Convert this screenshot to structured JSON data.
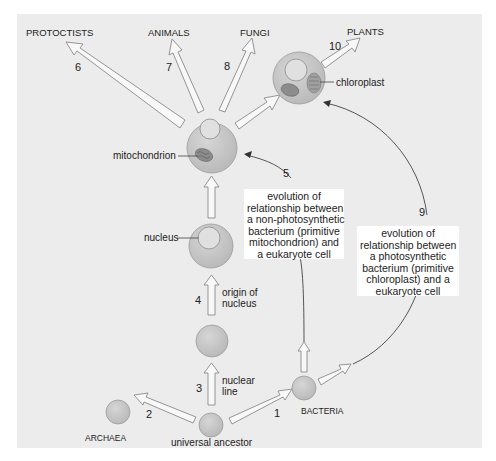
{
  "diagram": {
    "type": "evolutionary-tree",
    "colors": {
      "panel": "#ececec",
      "cell_fill": "#c8c8c8",
      "cell_stroke": "#9a9a9a",
      "nucleus_fill": "#e4e4e4",
      "arrow_fill": "#f8f8f8",
      "arrow_stroke": "#8a8a8a",
      "organelle_fill": "#8c8c8c",
      "line": "#444444",
      "label_box": "#ffffff"
    },
    "groups": {
      "protoctists": "PROTOCTISTS",
      "animals": "ANIMALS",
      "fungi": "FUNGI",
      "plants": "PLANTS",
      "archaea": "ARCHAEA",
      "bacteria": "BACTERIA"
    },
    "cells": {
      "universal_ancestor": "universal ancestor",
      "nucleus": "nucleus",
      "mitochondrion": "mitochondrion",
      "chloroplast": "chloroplast"
    },
    "steps": [
      {
        "number": "1",
        "from": "universal ancestor",
        "to": "BACTERIA"
      },
      {
        "number": "2",
        "from": "universal ancestor",
        "to": "ARCHAEA"
      },
      {
        "number": "3",
        "from": "universal ancestor",
        "to": "nuclear line cell",
        "label": [
          "nuclear",
          "line"
        ]
      },
      {
        "number": "4",
        "from": "nuclear line cell",
        "to": "nucleus cell",
        "label": [
          "origin of",
          "nucleus"
        ]
      },
      {
        "number": "5",
        "from": "BACTERIA",
        "to": "mitochondrion cell"
      },
      {
        "number": "6",
        "to": "PROTOCTISTS"
      },
      {
        "number": "7",
        "to": "ANIMALS"
      },
      {
        "number": "8",
        "to": "FUNGI"
      },
      {
        "number": "9",
        "from": "BACTERIA",
        "to": "chloroplast cell"
      },
      {
        "number": "10",
        "to": "PLANTS"
      }
    ],
    "step_labels": {
      "n1": "1",
      "n2": "2",
      "n3": "3",
      "n4": "4",
      "n5": "5",
      "n6": "6",
      "n7": "7",
      "n8": "8",
      "n9": "9",
      "n10": "10",
      "nuclear_line_1": "nuclear",
      "nuclear_line_2": "line",
      "origin_1": "origin of",
      "origin_2": "nucleus"
    },
    "boxes": {
      "mito_box": [
        "evolution of",
        "relationship between",
        "a non-photosynthetic",
        "bacterium (primitive",
        "mitochondrion) and",
        "a eukaryote cell"
      ],
      "chloro_box": [
        "evolution of",
        "relationship between",
        "a photosynthetic",
        "bacterium (primitive",
        "chloroplast) and a",
        "eukaryote cell"
      ]
    }
  }
}
